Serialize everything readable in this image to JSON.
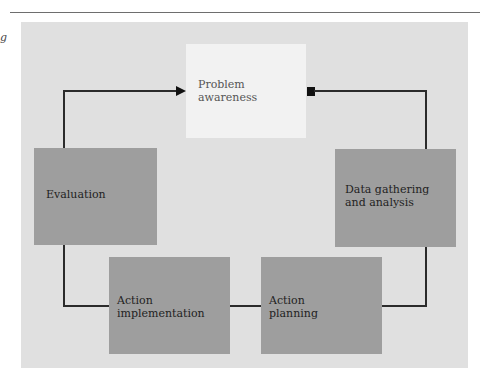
{
  "page": {
    "side_fragment": "g"
  },
  "diagram": {
    "type": "cycle",
    "nodes": [
      {
        "id": "problem",
        "label": "Problem\nawareness"
      },
      {
        "id": "data",
        "label": "Data gathering\nand analysis"
      },
      {
        "id": "planning",
        "label": "Action\nplanning"
      },
      {
        "id": "implementation",
        "label": "Action\nimplementation"
      },
      {
        "id": "evaluation",
        "label": "Evaluation"
      }
    ],
    "edges": [
      {
        "from": "evaluation",
        "to": "problem",
        "marker": "arrow"
      },
      {
        "from": "data",
        "to": "problem",
        "marker": "square"
      },
      {
        "from": "planning",
        "to": "data",
        "marker": "none"
      },
      {
        "from": "implementation",
        "to": "planning",
        "marker": "none"
      },
      {
        "from": "evaluation",
        "to": "implementation",
        "marker": "none"
      }
    ],
    "colors": {
      "panel": "#e0e0e0",
      "box": "#9e9e9e",
      "highlight_box": "#f2f2f2",
      "line": "#2b2b2b"
    }
  }
}
